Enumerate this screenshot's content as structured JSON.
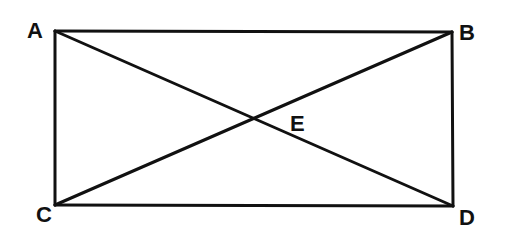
{
  "diagram": {
    "type": "rectangle-with-diagonals",
    "stroke_color": "#111111",
    "background": "#ffffff",
    "points": {
      "A": {
        "label": "A",
        "x": 55,
        "y": 31
      },
      "B": {
        "label": "B",
        "x": 452,
        "y": 32
      },
      "C": {
        "label": "C",
        "x": 55,
        "y": 205
      },
      "D": {
        "label": "D",
        "x": 453,
        "y": 206
      },
      "E": {
        "label": "E",
        "x": 254,
        "y": 118
      }
    },
    "segments": [
      {
        "name": "AB",
        "from": "A",
        "to": "B"
      },
      {
        "name": "BD",
        "from": "B",
        "to": "D"
      },
      {
        "name": "DC",
        "from": "D",
        "to": "C"
      },
      {
        "name": "CA",
        "from": "C",
        "to": "A"
      },
      {
        "name": "AD",
        "from": "A",
        "to": "D"
      },
      {
        "name": "CB",
        "from": "C",
        "to": "B"
      }
    ]
  }
}
